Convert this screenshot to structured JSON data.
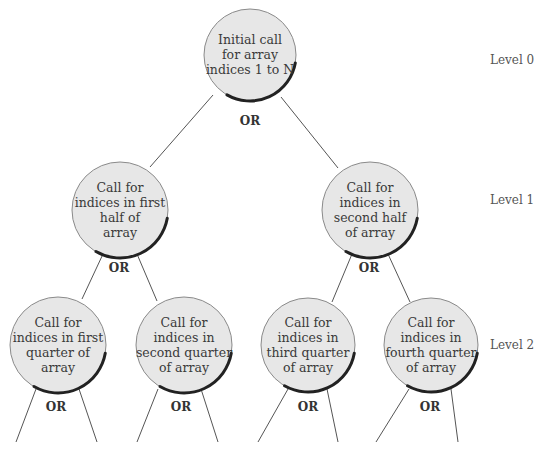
{
  "diagram": {
    "type": "recursion-tree",
    "connector_label": "OR",
    "levels": [
      {
        "label": "Level 0",
        "y": 60
      },
      {
        "label": "Level 1",
        "y": 200
      },
      {
        "label": "Level 2",
        "y": 345
      }
    ],
    "nodes": [
      {
        "id": "root",
        "level": 0,
        "cx": 250,
        "cy": 55,
        "r": 46,
        "lines": [
          "Initial call",
          "for array",
          "indices 1 to N"
        ],
        "or_x": 250,
        "or_y": 125
      },
      {
        "id": "first-half",
        "level": 1,
        "cx": 120,
        "cy": 210,
        "r": 48,
        "lines": [
          "Call for",
          "indices in first",
          "half of",
          "array"
        ],
        "or_x": 119,
        "or_y": 272
      },
      {
        "id": "second-half",
        "level": 1,
        "cx": 370,
        "cy": 210,
        "r": 48,
        "lines": [
          "Call for",
          "indices in",
          "second half",
          "of array"
        ],
        "or_x": 369,
        "or_y": 272
      },
      {
        "id": "first-quarter",
        "level": 2,
        "cx": 58,
        "cy": 345,
        "r": 48,
        "lines": [
          "Call for",
          "indices in first",
          "quarter of",
          "array"
        ],
        "or_x": 56,
        "or_y": 411
      },
      {
        "id": "second-quarter",
        "level": 2,
        "cx": 184,
        "cy": 345,
        "r": 48,
        "lines": [
          "Call for",
          "indices in",
          "second quarter",
          "of array"
        ],
        "or_x": 181,
        "or_y": 411
      },
      {
        "id": "third-quarter",
        "level": 2,
        "cx": 308,
        "cy": 345,
        "r": 47,
        "lines": [
          "Call for",
          "indices in",
          "third quarter",
          "of array"
        ],
        "or_x": 308,
        "or_y": 411
      },
      {
        "id": "fourth-quarter",
        "level": 2,
        "cx": 431,
        "cy": 345,
        "r": 47,
        "lines": [
          "Call for",
          "indices in",
          "fourth quarter",
          "of array"
        ],
        "or_x": 430,
        "or_y": 411
      }
    ],
    "edges": [
      [
        213,
        95,
        150,
        167
      ],
      [
        281,
        97,
        338,
        168
      ],
      [
        103,
        254,
        82,
        299
      ],
      [
        137,
        254,
        157,
        301
      ],
      [
        352,
        254,
        332,
        302
      ],
      [
        388,
        254,
        410,
        302
      ],
      [
        36,
        389,
        16,
        442
      ],
      [
        79,
        389,
        97,
        442
      ],
      [
        158,
        389,
        137,
        442
      ],
      [
        201,
        389,
        218,
        442
      ],
      [
        288,
        389,
        258,
        442
      ],
      [
        327,
        389,
        338,
        442
      ],
      [
        409,
        389,
        376,
        442
      ],
      [
        451,
        389,
        458,
        442
      ]
    ]
  }
}
